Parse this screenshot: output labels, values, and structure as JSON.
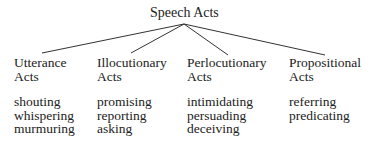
{
  "diagram": {
    "root": {
      "label": "Speech Acts"
    },
    "children": [
      {
        "label_line1": "Utterance",
        "label_line2": "Acts",
        "examples": [
          "shouting",
          "whispering",
          "murmuring"
        ]
      },
      {
        "label_line1": "Illocutionary",
        "label_line2": "Acts",
        "examples": [
          "promising",
          "reporting",
          "asking"
        ]
      },
      {
        "label_line1": "Perlocutionary",
        "label_line2": "Acts",
        "examples": [
          "intimidating",
          "persuading",
          "deceiving"
        ]
      },
      {
        "label_line1": "Propositional",
        "label_line2": "Acts",
        "examples": [
          "referring",
          "predicating"
        ]
      }
    ]
  }
}
